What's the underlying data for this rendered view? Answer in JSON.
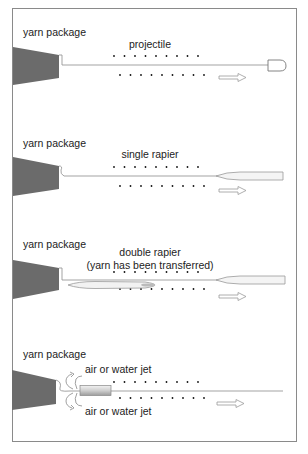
{
  "diagram": {
    "panels": [
      {
        "id": "projectile",
        "package_label": "yarn package",
        "carrier_label": "projectile",
        "carrier_type": "projectile"
      },
      {
        "id": "single-rapier",
        "package_label": "yarn package",
        "carrier_label": "single rapier",
        "carrier_type": "rapier"
      },
      {
        "id": "double-rapier",
        "package_label": "yarn package",
        "carrier_label": "double rapier",
        "carrier_sublabel": "(yarn has been transferred)",
        "carrier_type": "double-rapier"
      },
      {
        "id": "jet",
        "package_label": "yarn package",
        "jet_label_top": "air or water jet",
        "jet_label_bottom": "air or water jet",
        "carrier_type": "jet"
      }
    ],
    "colors": {
      "package": "#6b6b6b",
      "line": "#999999",
      "dots": "#111111",
      "frame": "#8a8a8a",
      "arrow": "#9a9a9a"
    }
  }
}
